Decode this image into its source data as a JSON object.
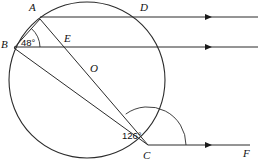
{
  "figure": {
    "stroke_color": "#2b2b2b",
    "label_color": "#111111",
    "background": "#ffffff"
  },
  "circle": {
    "center_label": "O",
    "cx": 87,
    "cy": 80,
    "r": 78
  },
  "points": [
    {
      "id": "A",
      "label": "A",
      "x": 40,
      "y": 19,
      "label_x": 29,
      "label_y": 2
    },
    {
      "id": "B",
      "label": "B",
      "x": 14,
      "y": 48,
      "label_x": 1,
      "label_y": 39
    },
    {
      "id": "C",
      "label": "C",
      "x": 148,
      "y": 145,
      "label_x": 143,
      "label_y": 150
    },
    {
      "id": "D",
      "label": "D",
      "x": 145,
      "y": 17,
      "label_x": 140,
      "label_y": 2
    },
    {
      "id": "E",
      "label": "E",
      "x": 68,
      "y": 47,
      "label_x": 64,
      "label_y": 33
    },
    {
      "id": "O",
      "label": "O",
      "x": 87,
      "y": 80,
      "label_x": 90,
      "label_y": 63
    },
    {
      "id": "F",
      "label": "F",
      "x": 245,
      "y": 145,
      "label_x": 243,
      "label_y": 148
    }
  ],
  "parallel_lines": [
    {
      "name": "line-through-A-and-D",
      "y": 17,
      "x_start": 40,
      "x_end": 258,
      "arrow_x": 216
    },
    {
      "name": "line-through-B-and-E",
      "y": 47,
      "x_start": 14,
      "x_end": 258,
      "arrow_x": 216
    },
    {
      "name": "line-through-C-and-F",
      "y": 145,
      "x_start": 148,
      "x_end": 250,
      "arrow_x": 216
    }
  ],
  "chords": [
    {
      "name": "chord-A-to-C",
      "from": "A",
      "to": "C"
    },
    {
      "name": "chord-B-to-C",
      "from": "B",
      "to": "C"
    },
    {
      "name": "chord-A-to-B",
      "from": "A",
      "to": "B"
    }
  ],
  "angles": [
    {
      "id": "angle-at-B",
      "vertex": "B",
      "value": "48°",
      "label_x": 21,
      "label_y": 38,
      "arc_radius": 26
    },
    {
      "id": "angle-at-C",
      "vertex": "C",
      "value": "126°",
      "label_x": 122,
      "label_y": 131,
      "arc_radius": 38
    }
  ]
}
